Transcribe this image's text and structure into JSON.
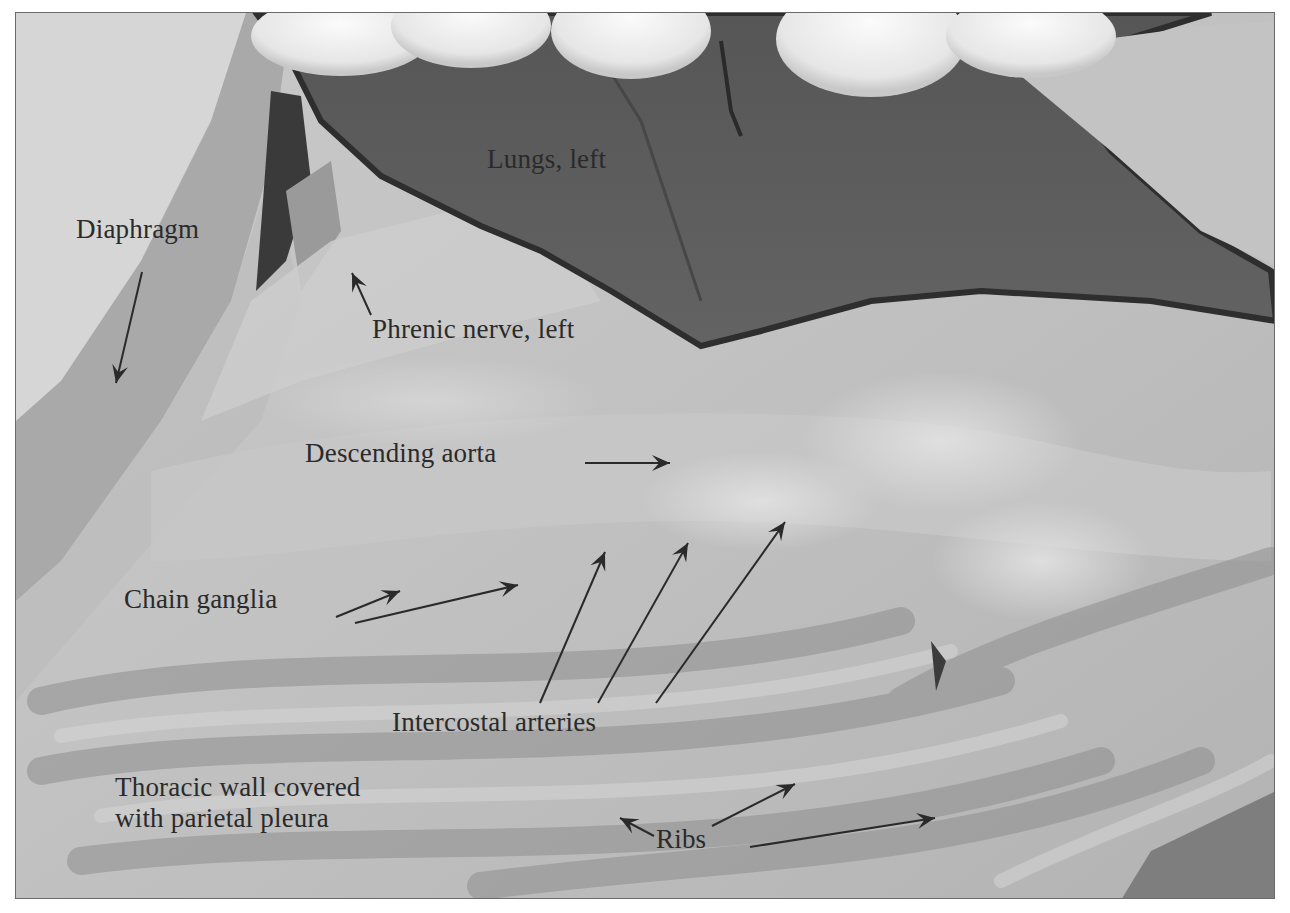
{
  "figure": {
    "frame": {
      "x": 15,
      "y": 12,
      "width": 1260,
      "height": 887,
      "border_color": "#6a6a6a"
    },
    "colors": {
      "tissue_light": "#cfcfcf",
      "tissue_mid": "#b4b4b4",
      "tissue_dark": "#8e8e8e",
      "lung": "#5c5c5c",
      "lung_edge": "#2e2e2e",
      "fingers": "#ededed",
      "label_text": "#2a2a2a",
      "arrow": "#2a2a2a"
    },
    "labels": [
      {
        "id": "lungs-left",
        "text": "Lungs, left",
        "x": 487,
        "y": 160
      },
      {
        "id": "diaphragm",
        "text": "Diaphragm",
        "x": 76,
        "y": 230
      },
      {
        "id": "phrenic-nerve-left",
        "text": "Phrenic nerve, left",
        "x": 372,
        "y": 330
      },
      {
        "id": "descending-aorta",
        "text": "Descending aorta",
        "x": 305,
        "y": 454
      },
      {
        "id": "chain-ganglia",
        "text": "Chain ganglia",
        "x": 124,
        "y": 600
      },
      {
        "id": "intercostal-arteries",
        "text": "Intercostal arteries",
        "x": 392,
        "y": 723
      },
      {
        "id": "thoracic-wall",
        "text": "Thoracic wall covered\nwith parietal pleura",
        "x": 115,
        "y": 788
      },
      {
        "id": "ribs",
        "text": "Ribs",
        "x": 656,
        "y": 840
      }
    ],
    "arrows": [
      {
        "id": "diaphragm-arrow",
        "x1": 142,
        "y1": 272,
        "x2": 116,
        "y2": 383
      },
      {
        "id": "phrenic-arrow",
        "x1": 371,
        "y1": 315,
        "x2": 352,
        "y2": 273
      },
      {
        "id": "aorta-arrow",
        "x1": 585,
        "y1": 463,
        "x2": 670,
        "y2": 463
      },
      {
        "id": "ganglia-arrow-1",
        "x1": 336,
        "y1": 617,
        "x2": 400,
        "y2": 591
      },
      {
        "id": "ganglia-arrow-2",
        "x1": 355,
        "y1": 623,
        "x2": 518,
        "y2": 585
      },
      {
        "id": "intercostal-arrow-1",
        "x1": 540,
        "y1": 703,
        "x2": 605,
        "y2": 552
      },
      {
        "id": "intercostal-arrow-2",
        "x1": 598,
        "y1": 703,
        "x2": 688,
        "y2": 543
      },
      {
        "id": "intercostal-arrow-3",
        "x1": 656,
        "y1": 703,
        "x2": 785,
        "y2": 522
      },
      {
        "id": "ribs-arrow-1",
        "x1": 654,
        "y1": 836,
        "x2": 620,
        "y2": 818
      },
      {
        "id": "ribs-arrow-2",
        "x1": 712,
        "y1": 826,
        "x2": 795,
        "y2": 784
      },
      {
        "id": "ribs-arrow-3",
        "x1": 750,
        "y1": 847,
        "x2": 935,
        "y2": 818
      }
    ]
  }
}
